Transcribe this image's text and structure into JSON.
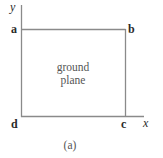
{
  "diagram": {
    "axes": {
      "x_label": "x",
      "y_label": "y"
    },
    "corners": {
      "a": "a",
      "b": "b",
      "c": "c",
      "d": "d"
    },
    "region_label_line1": "ground",
    "region_label_line2": "plane",
    "caption": "(a)",
    "line_color": "#8a8a8a"
  }
}
